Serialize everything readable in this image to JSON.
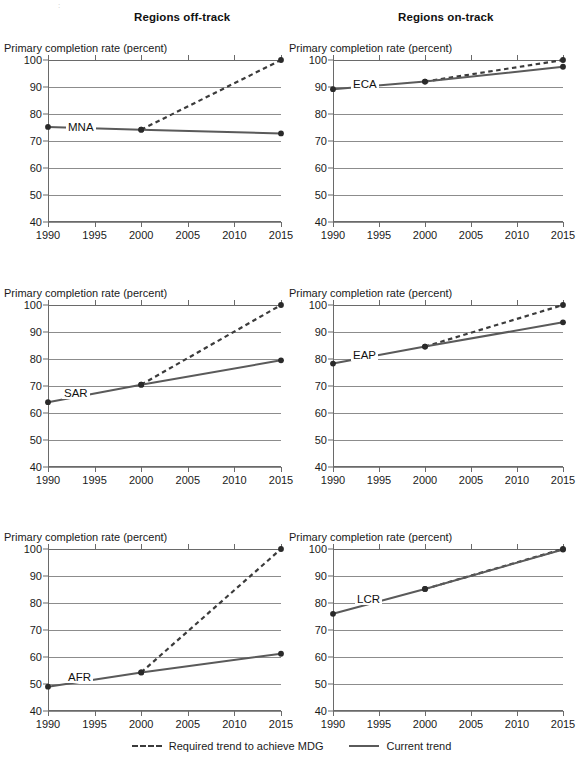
{
  "titles": {
    "off_track": "Regions off-track",
    "on_track": "Regions on-track"
  },
  "artifact_text": ":",
  "axis_title": "Primary completion rate (percent)",
  "legend": {
    "required_label": "Required trend to achieve MDG",
    "current_label": "Current trend",
    "required_style": "dashed",
    "current_style": "solid"
  },
  "colors": {
    "current_trend": "#5a5a5a",
    "required_trend": "#3b3b3b",
    "gridline": "#8c8c8c",
    "axis": "#6a6a6a",
    "text": "#1a1a1a"
  },
  "axes": {
    "ylabel": "Primary completion rate (percent)",
    "ylim": [
      40,
      100
    ],
    "yticks": [
      40,
      50,
      60,
      70,
      80,
      90,
      100
    ],
    "xlim": [
      1990,
      2015
    ],
    "xticks": [
      1990,
      1995,
      2000,
      2005,
      2010,
      2015
    ],
    "grid": true
  },
  "chart_data": [
    {
      "type": "line",
      "panel": "top-left",
      "group": "Regions off-track",
      "title": "",
      "region_code": "MNA",
      "xlabel": "",
      "ylabel": "Primary completion rate (percent)",
      "xlim": [
        1990,
        2015
      ],
      "ylim": [
        40,
        100
      ],
      "xticks": [
        1990,
        1995,
        2000,
        2005,
        2010,
        2015
      ],
      "yticks": [
        40,
        50,
        60,
        70,
        80,
        90,
        100
      ],
      "series": [
        {
          "name": "Current trend",
          "style": "solid",
          "x": [
            1990,
            2000,
            2015
          ],
          "values": [
            75.2,
            74.2,
            72.8
          ]
        },
        {
          "name": "Required trend to achieve MDG",
          "style": "dashed",
          "x": [
            2000,
            2015
          ],
          "values": [
            74.2,
            100
          ]
        }
      ]
    },
    {
      "type": "line",
      "panel": "top-right",
      "group": "Regions on-track",
      "title": "",
      "region_code": "ECA",
      "xlabel": "",
      "ylabel": "Primary completion rate (percent)",
      "xlim": [
        1990,
        2015
      ],
      "ylim": [
        40,
        100
      ],
      "xticks": [
        1990,
        1995,
        2000,
        2005,
        2010,
        2015
      ],
      "yticks": [
        40,
        50,
        60,
        70,
        80,
        90,
        100
      ],
      "series": [
        {
          "name": "Current trend",
          "style": "solid",
          "x": [
            1990,
            2000,
            2015
          ],
          "values": [
            89.2,
            92.0,
            97.5
          ]
        },
        {
          "name": "Required trend to achieve MDG",
          "style": "dashed",
          "x": [
            2000,
            2015
          ],
          "values": [
            92.0,
            100
          ]
        }
      ]
    },
    {
      "type": "line",
      "panel": "mid-left",
      "group": "Regions off-track",
      "title": "",
      "region_code": "SAR",
      "xlabel": "",
      "ylabel": "Primary completion rate (percent)",
      "xlim": [
        1990,
        2015
      ],
      "ylim": [
        40,
        100
      ],
      "xticks": [
        1990,
        1995,
        2000,
        2005,
        2010,
        2015
      ],
      "yticks": [
        40,
        50,
        60,
        70,
        80,
        90,
        100
      ],
      "series": [
        {
          "name": "Current trend",
          "style": "solid",
          "x": [
            1990,
            2000,
            2015
          ],
          "values": [
            64.0,
            70.5,
            79.5
          ]
        },
        {
          "name": "Required trend to achieve MDG",
          "style": "dashed",
          "x": [
            2000,
            2015
          ],
          "values": [
            70.5,
            100
          ]
        }
      ]
    },
    {
      "type": "line",
      "panel": "mid-right",
      "group": "Regions on-track",
      "title": "",
      "region_code": "EAP",
      "xlabel": "",
      "ylabel": "Primary completion rate (percent)",
      "xlim": [
        1990,
        2015
      ],
      "ylim": [
        40,
        100
      ],
      "xticks": [
        1990,
        1995,
        2000,
        2005,
        2010,
        2015
      ],
      "yticks": [
        40,
        50,
        60,
        70,
        80,
        90,
        100
      ],
      "series": [
        {
          "name": "Current trend",
          "style": "solid",
          "x": [
            1990,
            2000,
            2015
          ],
          "values": [
            78.3,
            84.6,
            93.6
          ]
        },
        {
          "name": "Required trend to achieve MDG",
          "style": "dashed",
          "x": [
            2000,
            2015
          ],
          "values": [
            84.6,
            100
          ]
        }
      ]
    },
    {
      "type": "line",
      "panel": "bottom-left",
      "group": "Regions off-track",
      "title": "",
      "region_code": "AFR",
      "xlabel": "",
      "ylabel": "Primary completion rate (percent)",
      "xlim": [
        1990,
        2015
      ],
      "ylim": [
        40,
        100
      ],
      "xticks": [
        1990,
        1995,
        2000,
        2005,
        2010,
        2015
      ],
      "yticks": [
        40,
        50,
        60,
        70,
        80,
        90,
        100
      ],
      "series": [
        {
          "name": "Current trend",
          "style": "solid",
          "x": [
            1990,
            2000,
            2015
          ],
          "values": [
            49.0,
            54.3,
            61.2
          ]
        },
        {
          "name": "Required trend to achieve MDG",
          "style": "dashed",
          "x": [
            2000,
            2015
          ],
          "values": [
            54.3,
            100
          ]
        }
      ]
    },
    {
      "type": "line",
      "panel": "bottom-right",
      "group": "Regions on-track",
      "title": "",
      "region_code": "LCR",
      "xlabel": "",
      "ylabel": "Primary completion rate (percent)",
      "xlim": [
        1990,
        2015
      ],
      "ylim": [
        40,
        100
      ],
      "xticks": [
        1990,
        1995,
        2000,
        2005,
        2010,
        2015
      ],
      "yticks": [
        40,
        50,
        60,
        70,
        80,
        90,
        100
      ],
      "series": [
        {
          "name": "Current trend",
          "style": "solid",
          "x": [
            1990,
            2000,
            2015
          ],
          "values": [
            76.0,
            85.2,
            99.8
          ]
        },
        {
          "name": "Required trend to achieve MDG",
          "style": "dashed",
          "x": [
            2000,
            2015
          ],
          "values": [
            85.2,
            100
          ]
        }
      ]
    }
  ],
  "panel_layout": [
    {
      "key": "top-left",
      "left": 4,
      "top": 42,
      "label_pos": {
        "x": 18,
        "y": 75.2
      }
    },
    {
      "key": "top-right",
      "left": 289,
      "top": 42,
      "label_pos": {
        "x": 18,
        "y": 91.0
      }
    },
    {
      "key": "mid-left",
      "left": 4,
      "top": 287,
      "label_pos": {
        "x": 14,
        "y": 67.5
      }
    },
    {
      "key": "mid-right",
      "left": 289,
      "top": 287,
      "label_pos": {
        "x": 18,
        "y": 81.5
      }
    },
    {
      "key": "bottom-left",
      "left": 4,
      "top": 531,
      "label_pos": {
        "x": 18,
        "y": 52.5
      }
    },
    {
      "key": "bottom-right",
      "left": 289,
      "top": 531,
      "label_pos": {
        "x": 22,
        "y": 81.5
      }
    }
  ]
}
